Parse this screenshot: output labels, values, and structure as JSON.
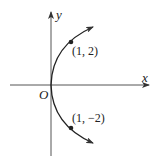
{
  "diagram": {
    "type": "parabola",
    "equation_implied": "y^2 = 4x",
    "axes": {
      "x_label": "x",
      "y_label": "y",
      "origin_label": "O"
    },
    "points": [
      {
        "label": "(1, 2)",
        "x": 1,
        "y": 2
      },
      {
        "label": "(1, −2)",
        "x": 1,
        "y": -2
      }
    ],
    "colors": {
      "curve": "#222222",
      "axis": "#444444"
    }
  }
}
